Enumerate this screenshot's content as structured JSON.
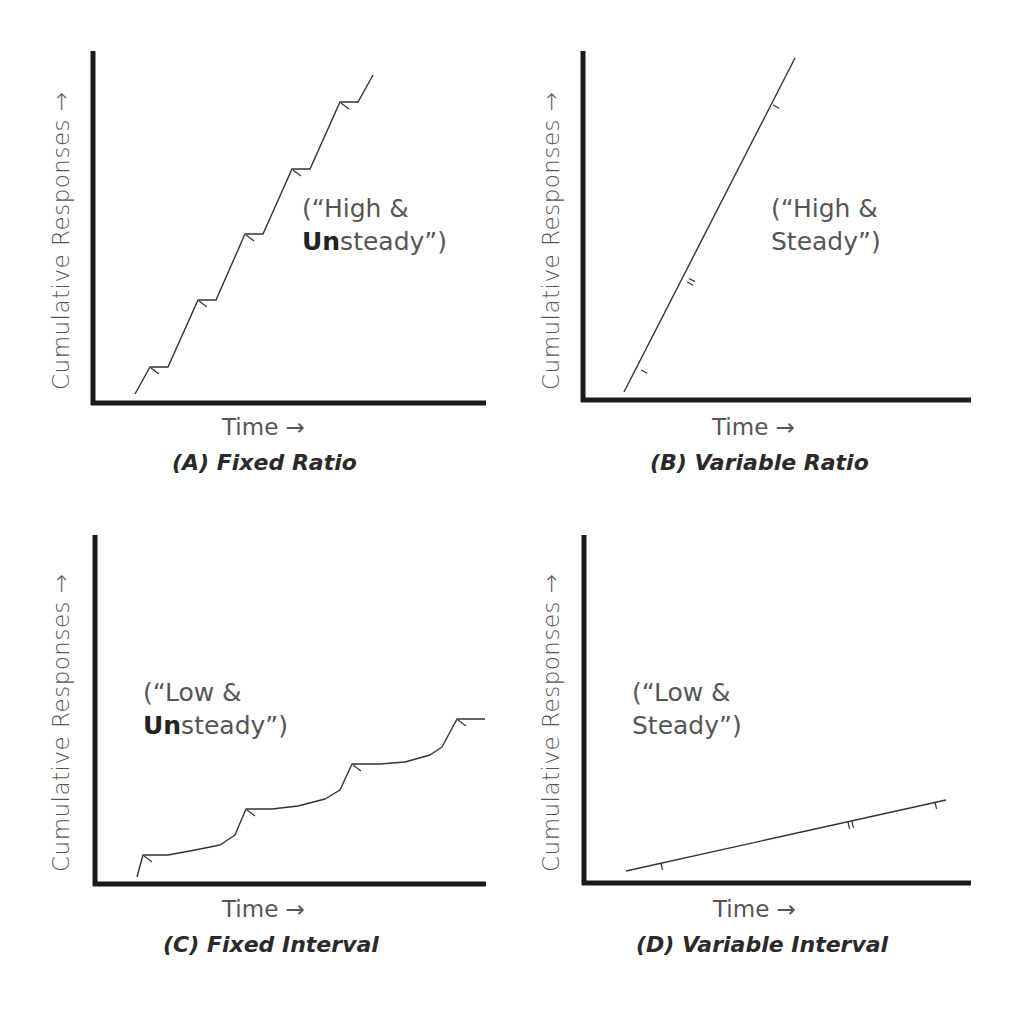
{
  "chart_data": [
    {
      "type": "line",
      "id": "A",
      "title": "(A) Fixed Ratio",
      "xlabel": "Time →",
      "ylabel": "Cumulative Responses →",
      "annotation": {
        "line1": "(“High &",
        "line2_bold": "Un",
        "line2_rest": "steady”)"
      },
      "description": "Steep staircase: rapid responding with short post-reinforcement pauses",
      "points": [
        [
          135,
          394
        ],
        [
          150,
          367
        ],
        [
          168,
          367
        ],
        [
          198,
          300
        ],
        [
          216,
          300
        ],
        [
          245,
          234
        ],
        [
          263,
          234
        ],
        [
          292,
          169
        ],
        [
          310,
          169
        ],
        [
          340,
          102
        ],
        [
          358,
          102
        ],
        [
          373,
          75
        ]
      ],
      "reinforcement_marks": [
        [
          150,
          367
        ],
        [
          198,
          300
        ],
        [
          245,
          234
        ],
        [
          292,
          169
        ],
        [
          340,
          102
        ]
      ],
      "grid": false
    },
    {
      "type": "line",
      "id": "B",
      "title": "(B) Variable Ratio",
      "xlabel": "Time →",
      "ylabel": "Cumulative Responses →",
      "annotation": {
        "line1": "(“High &",
        "line2_bold": "",
        "line2_rest": "Steady”)"
      },
      "description": "Steep steady straight line",
      "points": [
        [
          624,
          392
        ],
        [
          795,
          58
        ]
      ],
      "reinforcement_marks": [
        [
          641,
          370,
          1
        ],
        [
          687,
          282,
          2
        ],
        [
          773,
          105,
          1
        ]
      ],
      "grid": false
    },
    {
      "type": "line",
      "id": "C",
      "title": "(C) Fixed Interval",
      "xlabel": "Time →",
      "ylabel": "Cumulative Responses →",
      "annotation": {
        "line1": "(“Low &",
        "line2_bold": "Un",
        "line2_rest": "steady”)"
      },
      "description": "Scalloped pattern: pause after reinforcement, accelerating responding before next interval",
      "points": [
        [
          137,
          877
        ],
        [
          143,
          855
        ],
        [
          168,
          855
        ],
        [
          195,
          850
        ],
        [
          220,
          845
        ],
        [
          235,
          835
        ],
        [
          246,
          809
        ],
        [
          272,
          809
        ],
        [
          298,
          806
        ],
        [
          325,
          799
        ],
        [
          340,
          790
        ],
        [
          352,
          764
        ],
        [
          380,
          764
        ],
        [
          405,
          762
        ],
        [
          430,
          755
        ],
        [
          442,
          747
        ],
        [
          457,
          719
        ],
        [
          485,
          719
        ]
      ],
      "reinforcement_marks": [
        [
          143,
          855
        ],
        [
          246,
          809
        ],
        [
          352,
          764
        ],
        [
          457,
          719
        ]
      ],
      "grid": false
    },
    {
      "type": "line",
      "id": "D",
      "title": "(D) Variable Interval",
      "xlabel": "Time →",
      "ylabel": "Cumulative Responses →",
      "annotation": {
        "line1": "(“Low &",
        "line2_bold": "",
        "line2_rest": "Steady”)"
      },
      "description": "Shallow steady straight line",
      "points": [
        [
          626,
          871
        ],
        [
          946,
          800
        ]
      ],
      "reinforcement_marks": [
        [
          661,
          863,
          1
        ],
        [
          848,
          822,
          2
        ],
        [
          935,
          802,
          1
        ]
      ],
      "grid": false
    }
  ],
  "panels": {
    "A": {
      "caption": "(A) Fixed Ratio",
      "xlabel": "Time →",
      "ylabel": "Cumulative Responses →",
      "ann1": "(“High &",
      "ann2b": "Un",
      "ann2": "steady”)"
    },
    "B": {
      "caption": "(B) Variable Ratio",
      "xlabel": "Time →",
      "ylabel": "Cumulative Responses →",
      "ann1": "(“High &",
      "ann2b": "",
      "ann2": "Steady”)"
    },
    "C": {
      "caption": "(C) Fixed Interval",
      "xlabel": "Time →",
      "ylabel": "Cumulative Responses →",
      "ann1": "(“Low &",
      "ann2b": "Un",
      "ann2": "steady”)"
    },
    "D": {
      "caption": "(D) Variable Interval",
      "xlabel": "Time →",
      "ylabel": "Cumulative Responses →",
      "ann1": "(“Low &",
      "ann2b": "",
      "ann2": "Steady”)"
    }
  }
}
